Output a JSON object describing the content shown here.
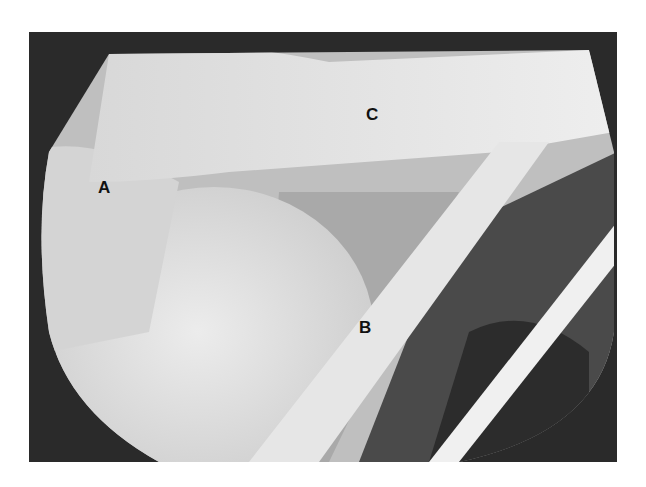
{
  "figure": {
    "type": "arthroscopic-photograph",
    "labels": [
      {
        "id": "A",
        "text": "A",
        "x": 98,
        "y": 178
      },
      {
        "id": "B",
        "text": "B",
        "x": 359,
        "y": 318
      },
      {
        "id": "C",
        "text": "C",
        "x": 366,
        "y": 105
      }
    ],
    "colors": {
      "border": "#2a2a2a",
      "tissue_light": "#e4e4e4",
      "tissue_mid": "#cfcfcf",
      "shadow": "#3a3a3a"
    }
  }
}
